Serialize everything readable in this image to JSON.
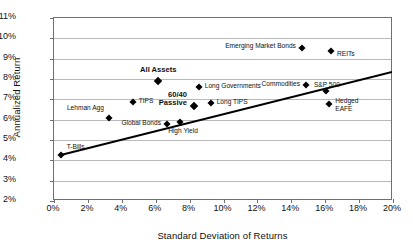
{
  "chart_data": {
    "type": "scatter",
    "title": "",
    "xlabel": "Standard Deviation of Returns",
    "ylabel": "Annualized Return",
    "xlim": [
      0,
      20
    ],
    "ylim": [
      2,
      11
    ],
    "xticks": [
      "0%",
      "2%",
      "4%",
      "6%",
      "8%",
      "10%",
      "12%",
      "14%",
      "16%",
      "18%",
      "20%"
    ],
    "yticks": [
      "2%",
      "3%",
      "4%",
      "5%",
      "6%",
      "7%",
      "8%",
      "9%",
      "10%",
      "11%"
    ],
    "xtick_values": [
      0,
      2,
      4,
      6,
      8,
      10,
      12,
      14,
      16,
      18,
      20
    ],
    "ytick_values": [
      2,
      3,
      4,
      5,
      6,
      7,
      8,
      9,
      10,
      11
    ],
    "grid": "horizontal",
    "legend": "none",
    "marker_shape": "diamond",
    "marker_color": "#000000",
    "points": [
      {
        "label": "T-Bills",
        "x": 0.45,
        "y": 4.2,
        "bold": false,
        "lx": 6,
        "ly": -9,
        "align": "left"
      },
      {
        "label": "Lehman Agg",
        "x": 3.3,
        "y": 6.05,
        "bold": false,
        "lx": -5,
        "ly": -10,
        "align": "right"
      },
      {
        "label": "TIPS",
        "x": 4.7,
        "y": 6.8,
        "bold": false,
        "lx": 6,
        "ly": -2,
        "align": "left"
      },
      {
        "label": "All Assets",
        "x": 6.2,
        "y": 7.85,
        "bold": true,
        "lx": 0,
        "ly": -13,
        "align": "center"
      },
      {
        "label": "Global Bonds",
        "x": 6.75,
        "y": 5.72,
        "bold": false,
        "lx": -6,
        "ly": -2,
        "align": "right"
      },
      {
        "label": "High Yield",
        "x": 7.5,
        "y": 5.85,
        "bold": false,
        "lx": 3,
        "ly": 9,
        "align": "center"
      },
      {
        "label": "60/40\nPassive",
        "x": 8.3,
        "y": 6.62,
        "bold": true,
        "lx": -7,
        "ly": -7,
        "align": "right"
      },
      {
        "label": "Long TIPS",
        "x": 9.3,
        "y": 6.75,
        "bold": false,
        "lx": 6,
        "ly": -2,
        "align": "left"
      },
      {
        "label": "Long Governments",
        "x": 8.6,
        "y": 7.55,
        "bold": false,
        "lx": 6,
        "ly": -2,
        "align": "left"
      },
      {
        "label": "Commodities",
        "x": 14.9,
        "y": 7.65,
        "bold": false,
        "lx": -6,
        "ly": -2,
        "align": "right"
      },
      {
        "label": "S&P 500",
        "x": 16.1,
        "y": 7.35,
        "bold": false,
        "lx": 1,
        "ly": -9,
        "align": "center"
      },
      {
        "label": "Emerging Market Bonds",
        "x": 14.7,
        "y": 9.5,
        "bold": false,
        "lx": -6,
        "ly": -2,
        "align": "right"
      },
      {
        "label": "REITs",
        "x": 16.4,
        "y": 9.35,
        "bold": false,
        "lx": 6,
        "ly": 3,
        "align": "left"
      },
      {
        "label": "Hedged\nEAFE",
        "x": 16.3,
        "y": 6.73,
        "bold": false,
        "lx": 6,
        "ly": 1,
        "align": "left"
      }
    ],
    "trendline": {
      "x0": 0.4,
      "y0": 4.2,
      "x1": 20.0,
      "y1": 8.3,
      "color": "#000000",
      "width": 1.9
    }
  }
}
